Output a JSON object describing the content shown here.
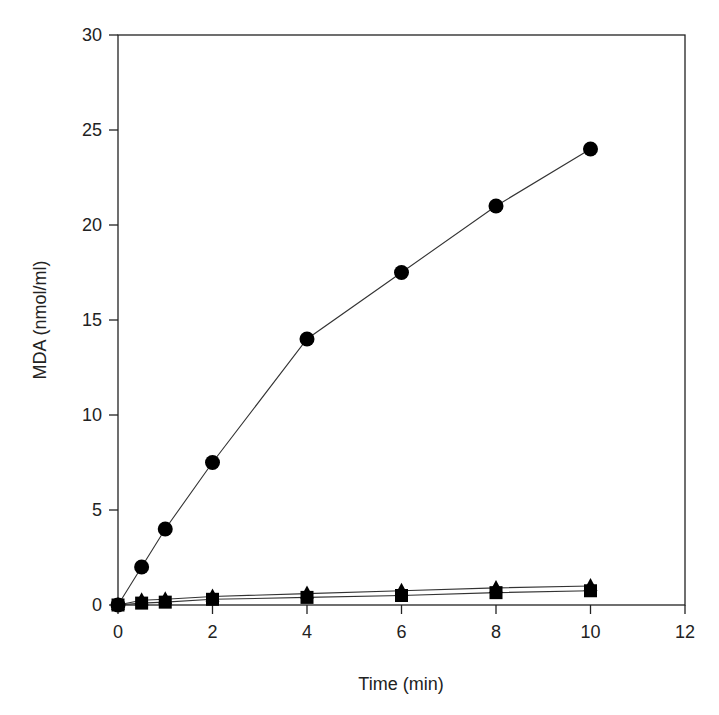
{
  "chart_data": {
    "type": "line",
    "title": "",
    "xlabel": "Time (min)",
    "ylabel": "MDA (nmol/ml)",
    "xlim": [
      0,
      12
    ],
    "ylim": [
      0,
      30
    ],
    "xticks": [
      0,
      2,
      4,
      6,
      8,
      10,
      12
    ],
    "yticks": [
      0,
      5,
      10,
      15,
      20,
      25,
      30
    ],
    "grid": false,
    "legend": null,
    "series": [
      {
        "name": "circles",
        "marker": "circle",
        "x": [
          0,
          0.5,
          1,
          2,
          4,
          6,
          8,
          10
        ],
        "y": [
          0,
          2,
          4,
          7.5,
          14,
          17.5,
          21,
          24
        ]
      },
      {
        "name": "triangles",
        "marker": "triangle",
        "x": [
          0,
          0.5,
          1,
          2,
          4,
          6,
          8,
          10
        ],
        "y": [
          0,
          0.25,
          0.3,
          0.45,
          0.6,
          0.75,
          0.9,
          1.0
        ]
      },
      {
        "name": "squares",
        "marker": "square",
        "x": [
          0,
          0.5,
          1,
          2,
          4,
          6,
          8,
          10
        ],
        "y": [
          0,
          0.1,
          0.15,
          0.3,
          0.4,
          0.5,
          0.65,
          0.75
        ]
      }
    ]
  },
  "colors": {
    "marker": "#000000",
    "line": "#333333",
    "axis": "#222222"
  }
}
